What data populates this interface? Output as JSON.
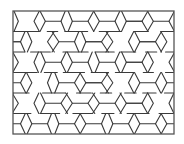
{
  "diagram": {
    "type": "tiling-pattern",
    "frame": {
      "x": 13,
      "y": 11,
      "width": 161,
      "height": 123
    },
    "stroke_color": "#3a3a3a",
    "frame_color": "#555555",
    "background": "#ffffff",
    "stroke_width": 1.1,
    "rows": 6,
    "row_ys": [
      11,
      31.5,
      52,
      72.5,
      93,
      113.5,
      134
    ],
    "cell_width": 27,
    "tile_shapes": [
      "hexagon",
      "bowtie"
    ]
  }
}
